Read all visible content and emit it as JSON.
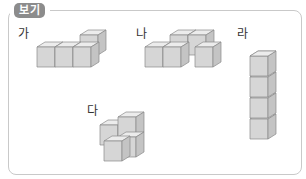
{
  "header": {
    "tag_label": "보기"
  },
  "figures": [
    {
      "id": "ga",
      "label": "가",
      "description": "L-shaped 4-cube arrangement: three cubes in a row with one cube behind the rightmost"
    },
    {
      "id": "na",
      "label": "나",
      "description": "Z-shaped 4-cube arrangement: two cubes front-left, two cubes back-right"
    },
    {
      "id": "da",
      "label": "다",
      "description": "4-cube arrangement: stacked cubes with one cube on top at back"
    },
    {
      "id": "ra",
      "label": "라",
      "description": "Vertical tower of 4 stacked cubes"
    }
  ],
  "colors": {
    "cube_top": "#ececec",
    "cube_front": "#d6d6d6",
    "cube_side": "#c4c4c4",
    "edge": "#8a8a8a",
    "frame_border": "#c9c9c9",
    "tag_bg": "#8c8c8c"
  }
}
